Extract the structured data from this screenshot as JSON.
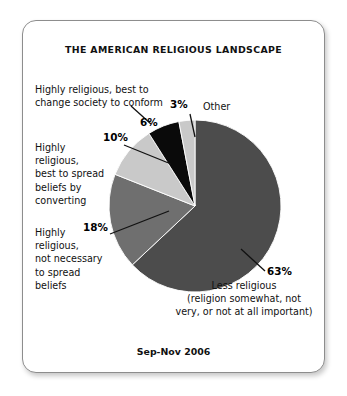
{
  "chart_data": {
    "type": "pie",
    "title": "THE AMERICAN RELIGIOUS LANDSCAPE",
    "subtitle": "Sep-Nov 2006",
    "xlabel": "",
    "ylabel": "",
    "legend_position": "callout-labels",
    "grid": false,
    "categories": [
      "Less religious (religion somewhat, not very, or not at all important)",
      "Highly religious, not necessary to spread beliefs",
      "Highly religious, best to spread beliefs by converting",
      "Highly religious, best to change society to conform",
      "Other"
    ],
    "values": [
      63,
      18,
      10,
      6,
      3
    ],
    "value_labels": [
      "63%",
      "18%",
      "10%",
      "6%",
      "3%"
    ],
    "colors": [
      "#4c4c4c",
      "#6f6f6f",
      "#c9c9c9",
      "#0a0a0a",
      "#c9c9c9"
    ],
    "slices": [
      {
        "name": "less-religious",
        "percent": 63,
        "percent_label": "63%",
        "label": "Less religious\n(religion somewhat, not\nvery, or not at all important)",
        "color": "#4c4c4c"
      },
      {
        "name": "not-necessary-to-spread",
        "percent": 18,
        "percent_label": "18%",
        "label": "Highly\nreligious,\nnot necessary\nto spread\nbeliefs",
        "color": "#6f6f6f"
      },
      {
        "name": "spread-by-converting",
        "percent": 10,
        "percent_label": "10%",
        "label": "Highly\nreligious,\nbest to spread\nbeliefs by\nconverting",
        "color": "#c9c9c9"
      },
      {
        "name": "change-society-to-conform",
        "percent": 6,
        "percent_label": "6%",
        "label": "Highly religious, best to\nchange society to conform",
        "color": "#0a0a0a"
      },
      {
        "name": "other",
        "percent": 3,
        "percent_label": "3%",
        "label": "Other",
        "color": "#c9c9c9"
      }
    ]
  },
  "card": {
    "title": "THE AMERICAN RELIGIOUS LANDSCAPE",
    "footer_date": "Sep-Nov 2006"
  }
}
